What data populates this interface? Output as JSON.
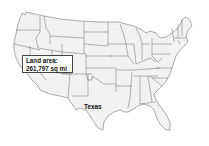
{
  "map": {
    "title": "Contiguous United States",
    "fill_color": "#f2f2f2",
    "border_color": "#4a4a4a",
    "highlighted_state": "Texas"
  },
  "callout": {
    "line1": "Land area:",
    "line2": "261,797 sq mi"
  },
  "labels": {
    "texas": "Texas"
  }
}
